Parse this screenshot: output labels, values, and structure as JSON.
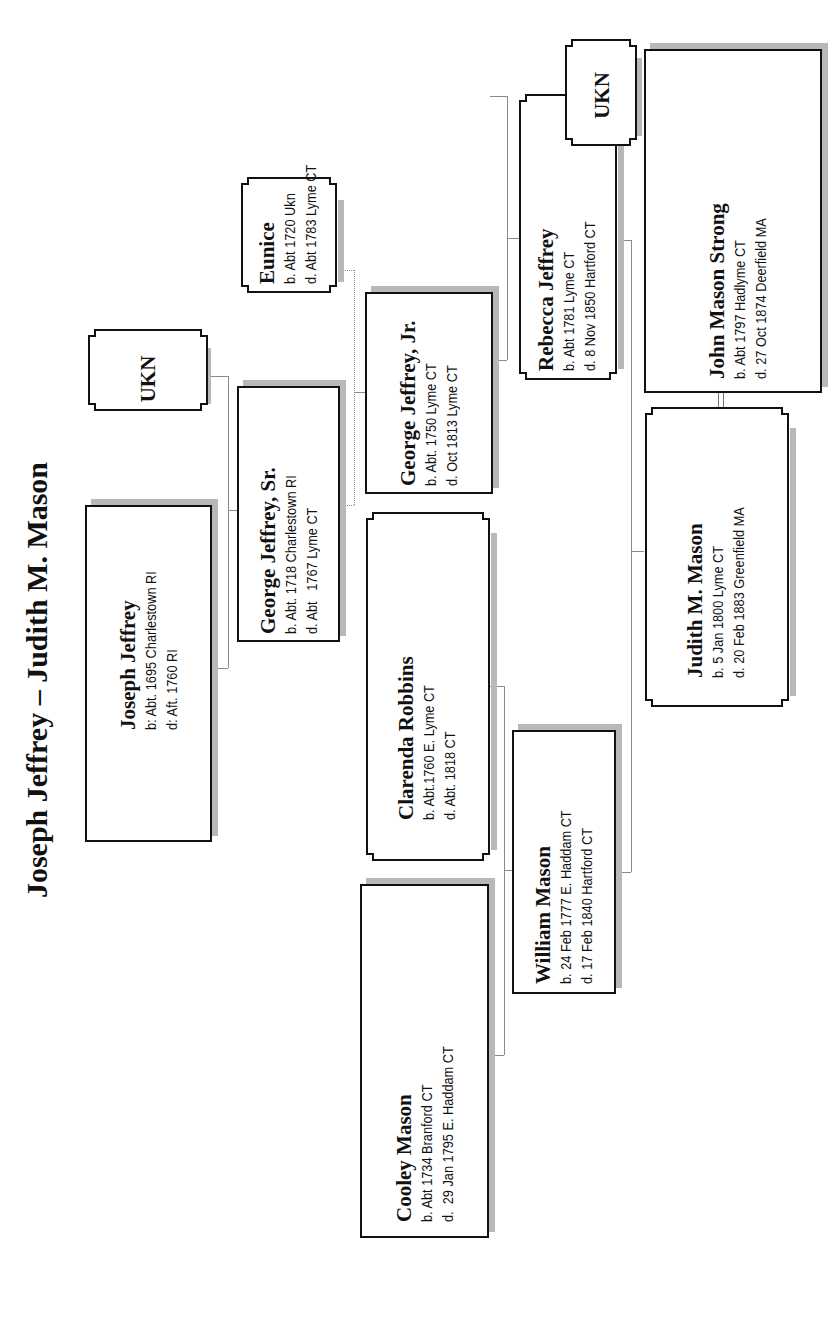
{
  "title": "Joseph Jeffrey – Judith M. Mason",
  "colors": {
    "border": "#111111",
    "shadow": "#b8b8b8",
    "connector": "#8a8a8a",
    "background": "#ffffff"
  },
  "people": {
    "joseph_jeffrey": {
      "name": "Joseph Jeffrey",
      "birth": "b: Abt. 1695 Charlestown RI",
      "death": "d: Aft. 1760 RI"
    },
    "ukn_1": {
      "name": "UKN"
    },
    "george_sr": {
      "name": "George Jeffrey, Sr.",
      "birth": "b. Abt. 1718 Charlestown RI",
      "death": "d. Abt   1767 Lyme CT"
    },
    "eunice": {
      "name": "Eunice",
      "birth": "b. Abt 1720 Ukn",
      "death": "d. Abt 1783 Lyme CT"
    },
    "george_jr": {
      "name": "George Jeffrey, Jr.",
      "birth": "b. Abt. 1750 Lyme CT",
      "death": "d. Oct 1813 Lyme CT"
    },
    "clarenda_robbins": {
      "name": "Clarenda Robbins",
      "birth": "b. Abt.1760 E. Lyme CT",
      "death": "d. Abt. 1818 CT"
    },
    "cooley_mason": {
      "name": "Cooley Mason",
      "birth": "b. Abt 1734 Branford CT",
      "death": "d.  29 Jan 1795 E. Haddam CT"
    },
    "william_mason": {
      "name": "William Mason",
      "birth": "b. 24 Feb 1777 E. Haddam CT",
      "death": "d. 17 Feb 1840 Hartford CT"
    },
    "rebecca_jeffrey": {
      "name": "Rebecca Jeffrey",
      "birth": "b. Abt 1781 Lyme CT",
      "death": "d. 8 Nov 1850 Hartford CT"
    },
    "ukn_2": {
      "name": "UKN"
    },
    "john_mason_strong": {
      "name": "John Mason Strong",
      "birth": "b. Abt 1797 Hadlyme CT",
      "death": "d. 27 Oct 1874 Deerfield MA"
    },
    "judith_mason": {
      "name": "Judith M. Mason",
      "birth": "b. 5 Jan 1800 Lyme CT",
      "death": "d. 20 Feb 1883 Greenfield MA"
    }
  }
}
